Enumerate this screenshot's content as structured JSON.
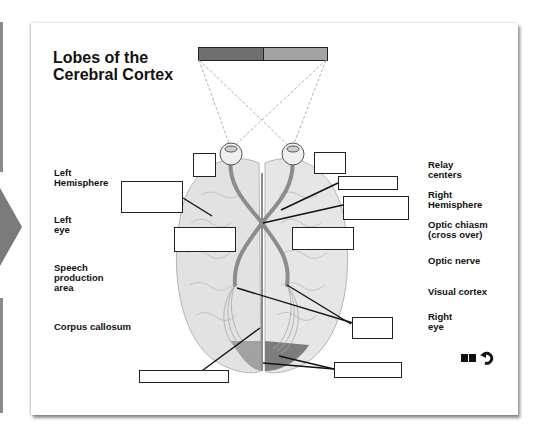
{
  "page": {
    "title": "Lobes of the\nCerebral Cortex"
  },
  "colors": {
    "lobe_bar_left": "#6f6f6f",
    "lobe_bar_right": "#a3a3a3",
    "brain_fill": "#e2e2e2",
    "optic_path": "#8c8c8c",
    "visual_cortex_left": "#a2a2a2",
    "visual_cortex_right": "#7d7d7d",
    "arrow": "#7a7a7a"
  },
  "left_labels": [
    {
      "id": "left-hemisphere",
      "text": "Left\nHemisphere"
    },
    {
      "id": "left-eye",
      "text": "Left\neye"
    },
    {
      "id": "speech-production-area",
      "text": "Speech\nproduction\narea"
    },
    {
      "id": "corpus-callosum",
      "text": "Corpus callosum"
    }
  ],
  "right_labels": [
    {
      "id": "relay-centers",
      "text": "Relay\ncenters"
    },
    {
      "id": "right-hemisphere",
      "text": "Right\nHemisphere"
    },
    {
      "id": "optic-chiasm",
      "text": "Optic chiasm\n(cross over)"
    },
    {
      "id": "optic-nerve",
      "text": "Optic nerve"
    },
    {
      "id": "visual-cortex",
      "text": "Visual cortex"
    },
    {
      "id": "right-eye",
      "text": "Right\neye"
    }
  ],
  "answer_boxes": [
    {
      "id": "box-left-eye-top"
    },
    {
      "id": "box-left-hemisphere"
    },
    {
      "id": "box-left-mid"
    },
    {
      "id": "box-right-eye-top"
    },
    {
      "id": "box-optic-nerve"
    },
    {
      "id": "box-optic-chiasm"
    },
    {
      "id": "box-right-mid"
    },
    {
      "id": "box-relay-centers"
    },
    {
      "id": "box-corpus-callosum"
    },
    {
      "id": "box-visual-cortex"
    }
  ],
  "controls": {
    "book_icon": "book-icon",
    "undo_icon": "undo-icon"
  }
}
